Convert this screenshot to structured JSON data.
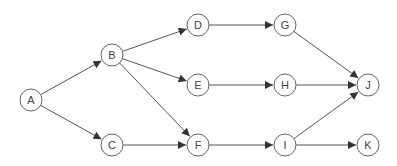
{
  "diagram": {
    "type": "directed-graph",
    "node_radius": 11,
    "colors": {
      "node_stroke": "#666666",
      "edge": "#555555",
      "label": "#444444",
      "background": "#ffffff"
    },
    "nodes": [
      {
        "id": "A",
        "label": "A",
        "x": 31,
        "y": 100
      },
      {
        "id": "B",
        "label": "B",
        "x": 112,
        "y": 55
      },
      {
        "id": "C",
        "label": "C",
        "x": 112,
        "y": 145
      },
      {
        "id": "D",
        "label": "D",
        "x": 198,
        "y": 25
      },
      {
        "id": "E",
        "label": "E",
        "x": 198,
        "y": 85
      },
      {
        "id": "F",
        "label": "F",
        "x": 198,
        "y": 145
      },
      {
        "id": "G",
        "label": "G",
        "x": 285,
        "y": 25
      },
      {
        "id": "H",
        "label": "H",
        "x": 285,
        "y": 85
      },
      {
        "id": "I",
        "label": "I",
        "x": 285,
        "y": 145
      },
      {
        "id": "J",
        "label": "J",
        "x": 368,
        "y": 85
      },
      {
        "id": "K",
        "label": "K",
        "x": 368,
        "y": 145
      }
    ],
    "edges": [
      {
        "from": "A",
        "to": "B"
      },
      {
        "from": "A",
        "to": "C"
      },
      {
        "from": "B",
        "to": "D"
      },
      {
        "from": "B",
        "to": "E"
      },
      {
        "from": "B",
        "to": "F"
      },
      {
        "from": "C",
        "to": "F"
      },
      {
        "from": "D",
        "to": "G"
      },
      {
        "from": "E",
        "to": "H"
      },
      {
        "from": "F",
        "to": "I"
      },
      {
        "from": "G",
        "to": "J"
      },
      {
        "from": "H",
        "to": "J"
      },
      {
        "from": "I",
        "to": "J"
      },
      {
        "from": "I",
        "to": "K"
      }
    ]
  }
}
